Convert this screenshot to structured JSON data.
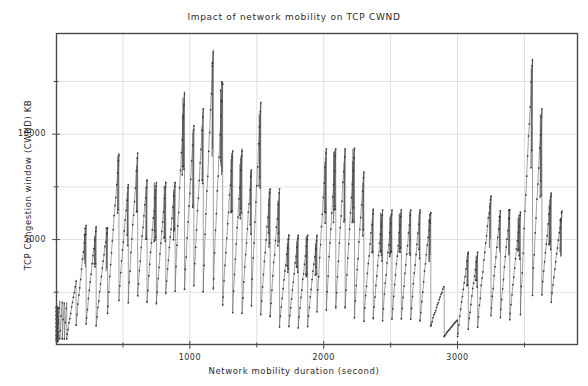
{
  "chart_data": {
    "type": "line",
    "title": "Impact of network mobility on TCP CWND",
    "xlabel": "Network mobility duration  (second)",
    "ylabel": "TCP Congestion window (CWND) KB",
    "xlim": [
      0,
      3900
    ],
    "ylim": [
      0,
      14800
    ],
    "grid": true,
    "legend": "none",
    "marker": "dot",
    "line_color": "#555555",
    "marker_color": "#333333",
    "xticks": [
      1000,
      2000,
      3000
    ],
    "xtick_labels": [
      "1000",
      "2000",
      "3000"
    ],
    "x_minor_ticks": [
      500,
      1500,
      2500,
      3500
    ],
    "yticks": [
      5000,
      10000
    ],
    "ytick_labels": [
      "5000",
      "10000"
    ],
    "y_minor_ticks": [
      2500,
      7500,
      12500
    ],
    "series": [
      {
        "name": "TCP CWND",
        "description": "Sawtooth TCP congestion window trace with repeated additive-increase ramps and multiplicative-decrease drops; peaks reach about 14000 KB near 1100 s and a deep collapse to near 400 KB at about 3000 s.",
        "sawtooth_cycles": [
          {
            "x_start": 10,
            "x_end": 28,
            "y_start": 300,
            "y_peak": 2100
          },
          {
            "x_start": 28,
            "x_end": 46,
            "y_start": 300,
            "y_peak": 2050
          },
          {
            "x_start": 46,
            "x_end": 62,
            "y_start": 280,
            "y_peak": 2000
          },
          {
            "x_start": 62,
            "x_end": 80,
            "y_start": 280,
            "y_peak": 2050
          },
          {
            "x_start": 80,
            "x_end": 150,
            "y_start": 300,
            "y_peak": 3000
          },
          {
            "x_start": 150,
            "x_end": 225,
            "y_start": 900,
            "y_peak": 5600
          },
          {
            "x_start": 225,
            "x_end": 300,
            "y_start": 1000,
            "y_peak": 5600
          },
          {
            "x_start": 300,
            "x_end": 385,
            "y_start": 900,
            "y_peak": 5600
          },
          {
            "x_start": 385,
            "x_end": 470,
            "y_start": 1500,
            "y_peak": 9000
          },
          {
            "x_start": 470,
            "x_end": 540,
            "y_start": 2200,
            "y_peak": 7600
          },
          {
            "x_start": 540,
            "x_end": 610,
            "y_start": 2100,
            "y_peak": 9100
          },
          {
            "x_start": 610,
            "x_end": 680,
            "y_start": 2300,
            "y_peak": 7800
          },
          {
            "x_start": 680,
            "x_end": 750,
            "y_start": 2000,
            "y_peak": 7700
          },
          {
            "x_start": 750,
            "x_end": 820,
            "y_start": 1900,
            "y_peak": 7700
          },
          {
            "x_start": 820,
            "x_end": 890,
            "y_start": 2400,
            "y_peak": 7700
          },
          {
            "x_start": 890,
            "x_end": 960,
            "y_start": 2600,
            "y_peak": 11900
          },
          {
            "x_start": 960,
            "x_end": 1030,
            "y_start": 2600,
            "y_peak": 10400
          },
          {
            "x_start": 1030,
            "x_end": 1100,
            "y_start": 2800,
            "y_peak": 11200
          },
          {
            "x_start": 1100,
            "x_end": 1175,
            "y_start": 2700,
            "y_peak": 14000
          },
          {
            "x_start": 1175,
            "x_end": 1245,
            "y_start": 2700,
            "y_peak": 12500
          },
          {
            "x_start": 1245,
            "x_end": 1320,
            "y_start": 1900,
            "y_peak": 9200
          },
          {
            "x_start": 1320,
            "x_end": 1390,
            "y_start": 1600,
            "y_peak": 9200
          },
          {
            "x_start": 1390,
            "x_end": 1460,
            "y_start": 1500,
            "y_peak": 8300
          },
          {
            "x_start": 1460,
            "x_end": 1530,
            "y_start": 2000,
            "y_peak": 11500
          },
          {
            "x_start": 1530,
            "x_end": 1600,
            "y_start": 1500,
            "y_peak": 7400
          },
          {
            "x_start": 1600,
            "x_end": 1670,
            "y_start": 1300,
            "y_peak": 7400
          },
          {
            "x_start": 1670,
            "x_end": 1740,
            "y_start": 900,
            "y_peak": 5200
          },
          {
            "x_start": 1740,
            "x_end": 1810,
            "y_start": 850,
            "y_peak": 5200
          },
          {
            "x_start": 1810,
            "x_end": 1880,
            "y_start": 850,
            "y_peak": 5200
          },
          {
            "x_start": 1880,
            "x_end": 1950,
            "y_start": 900,
            "y_peak": 5200
          },
          {
            "x_start": 1950,
            "x_end": 2020,
            "y_start": 1700,
            "y_peak": 9300
          },
          {
            "x_start": 2020,
            "x_end": 2090,
            "y_start": 1700,
            "y_peak": 9300
          },
          {
            "x_start": 2090,
            "x_end": 2160,
            "y_start": 1700,
            "y_peak": 9300
          },
          {
            "x_start": 2160,
            "x_end": 2230,
            "y_start": 1700,
            "y_peak": 9300
          },
          {
            "x_start": 2230,
            "x_end": 2300,
            "y_start": 1400,
            "y_peak": 8200
          },
          {
            "x_start": 2300,
            "x_end": 2370,
            "y_start": 1200,
            "y_peak": 6400
          },
          {
            "x_start": 2370,
            "x_end": 2440,
            "y_start": 1200,
            "y_peak": 6400
          },
          {
            "x_start": 2440,
            "x_end": 2510,
            "y_start": 1200,
            "y_peak": 6400
          },
          {
            "x_start": 2510,
            "x_end": 2580,
            "y_start": 1200,
            "y_peak": 6400
          },
          {
            "x_start": 2580,
            "x_end": 2650,
            "y_start": 1200,
            "y_peak": 6400
          },
          {
            "x_start": 2650,
            "x_end": 2720,
            "y_start": 1200,
            "y_peak": 6400
          },
          {
            "x_start": 2720,
            "x_end": 2800,
            "y_start": 1100,
            "y_peak": 6300
          },
          {
            "x_start": 2800,
            "x_end": 2900,
            "y_start": 900,
            "y_peak": 2800
          },
          {
            "x_start": 2900,
            "x_end": 3000,
            "y_start": 400,
            "y_peak": 1200
          },
          {
            "x_start": 3000,
            "x_end": 3080,
            "y_start": 400,
            "y_peak": 4400
          },
          {
            "x_start": 3080,
            "x_end": 3150,
            "y_start": 800,
            "y_peak": 4400
          },
          {
            "x_start": 3150,
            "x_end": 3250,
            "y_start": 900,
            "y_peak": 7100
          },
          {
            "x_start": 3250,
            "x_end": 3320,
            "y_start": 1400,
            "y_peak": 6400
          },
          {
            "x_start": 3320,
            "x_end": 3390,
            "y_start": 1300,
            "y_peak": 6400
          },
          {
            "x_start": 3390,
            "x_end": 3470,
            "y_start": 1200,
            "y_peak": 6300
          },
          {
            "x_start": 3470,
            "x_end": 3560,
            "y_start": 1500,
            "y_peak": 13500
          },
          {
            "x_start": 3560,
            "x_end": 3630,
            "y_start": 2500,
            "y_peak": 11200
          },
          {
            "x_start": 3630,
            "x_end": 3700,
            "y_start": 2400,
            "y_peak": 7200
          },
          {
            "x_start": 3700,
            "x_end": 3780,
            "y_start": 2000,
            "y_peak": 6300
          }
        ]
      }
    ]
  }
}
